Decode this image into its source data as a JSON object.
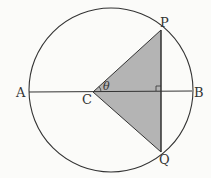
{
  "diagram": {
    "type": "circle-geometry",
    "labels": {
      "A": "A",
      "B": "B",
      "C": "C",
      "P": "P",
      "Q": "Q",
      "angle": "θ"
    },
    "colors": {
      "stroke": "#333333",
      "shaded_triangle": "#b4b4b4",
      "background": "#fbfbf9"
    },
    "elements": {
      "circle": "circle with diameter AB",
      "diameter": "AB",
      "chord": "PQ perpendicular to AB",
      "triangle": "CPQ shaded",
      "angle_marker": "angle PCB = θ",
      "right_angle_marker": "at intersection of PQ and AB"
    }
  }
}
